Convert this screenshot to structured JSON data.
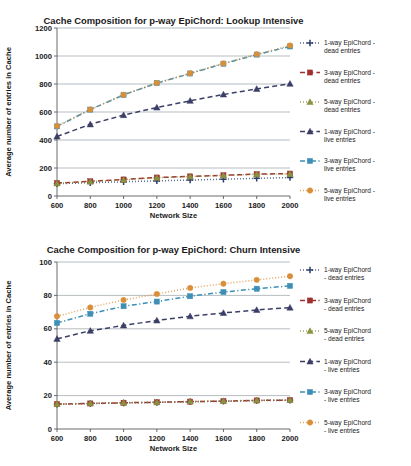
{
  "figure": {
    "name": "cache-composition-figure",
    "panel_count": 2
  },
  "palette": {
    "dead_1way": "#2b3f6c",
    "dead_3way": "#9e3030",
    "dead_5way": "#8a9141",
    "live_1way": "#3b3f66",
    "live_3way": "#3d8fb5",
    "live_5way": "#d98f3a",
    "gridline": "#9aa0a6",
    "axis": "#595959",
    "text": "#1a1a1a",
    "background": "#ffffff"
  },
  "chart_data": [
    {
      "id": "lookup-intensive",
      "type": "line",
      "title": "Cache Composition for p-way EpiChord: Lookup Intensive",
      "xlabel": "Network Size",
      "ylabel": "Average number of entries in Cache",
      "x": [
        600,
        800,
        1000,
        1200,
        1400,
        1600,
        1800,
        2000
      ],
      "xlim": [
        600,
        2000
      ],
      "ylim": [
        0,
        1200
      ],
      "yticks": [
        0,
        200,
        400,
        600,
        800,
        1000,
        1200
      ],
      "xticks": [
        600,
        800,
        1000,
        1200,
        1400,
        1600,
        1800,
        2000
      ],
      "grid": true,
      "legend_position": "right",
      "series": [
        {
          "name": "1-way EpiChord - dead entries",
          "key": "dead_1way",
          "color": "#2b3f6c",
          "dash": "dotted",
          "marker": "plus",
          "values": [
            88,
            95,
            102,
            108,
            114,
            120,
            126,
            132
          ]
        },
        {
          "name": "3-way EpiChord - dead entries",
          "key": "dead_3way",
          "color": "#9e3030",
          "dash": "dashed",
          "marker": "square",
          "values": [
            92,
            105,
            118,
            132,
            140,
            148,
            156,
            160
          ]
        },
        {
          "name": "5-way EpiChord - dead entries",
          "key": "dead_5way",
          "color": "#8a9141",
          "dash": "dotted",
          "marker": "triangle",
          "values": [
            90,
            103,
            116,
            130,
            139,
            147,
            155,
            158
          ]
        },
        {
          "name": "1-way EpiChord - live entries",
          "key": "live_1way",
          "color": "#3b3f66",
          "dash": "dashed",
          "marker": "triangle",
          "values": [
            425,
            512,
            578,
            632,
            680,
            725,
            765,
            802
          ]
        },
        {
          "name": "3-way EpiChord - live entries",
          "key": "live_3way",
          "color": "#3d8fb5",
          "dash": "dashdot",
          "marker": "square",
          "values": [
            497,
            617,
            722,
            806,
            875,
            945,
            1010,
            1068
          ]
        },
        {
          "name": "5-way EpiChord - live entries",
          "key": "live_5way",
          "color": "#d98f3a",
          "dash": "dotted",
          "marker": "circle",
          "values": [
            500,
            618,
            723,
            807,
            877,
            947,
            1012,
            1075
          ]
        }
      ]
    },
    {
      "id": "churn-intensive",
      "type": "line",
      "title": "Cache Composition for p-way EpiChord: Churn Intensive",
      "xlabel": "Network Size",
      "ylabel": "Average number of entries in Cache",
      "x": [
        600,
        800,
        1000,
        1200,
        1400,
        1600,
        1800,
        2000
      ],
      "xlim": [
        600,
        2000
      ],
      "ylim": [
        0,
        100
      ],
      "yticks": [
        0,
        20,
        40,
        60,
        80,
        100
      ],
      "xticks": [
        600,
        800,
        1000,
        1200,
        1400,
        1600,
        1800,
        2000
      ],
      "grid": true,
      "legend_position": "right",
      "series": [
        {
          "name": "1-way EpiChord - dead entries",
          "key": "dead_1way",
          "color": "#2b3f6c",
          "dash": "dotted",
          "marker": "plus",
          "values": [
            14.8,
            15.2,
            15.6,
            15.9,
            16.3,
            16.6,
            17.0,
            17.2
          ]
        },
        {
          "name": "3-way EpiChord - dead entries",
          "key": "dead_3way",
          "color": "#9e3030",
          "dash": "dashdot",
          "marker": "square",
          "values": [
            14.9,
            15.3,
            15.7,
            16.0,
            16.4,
            16.7,
            17.1,
            17.3
          ]
        },
        {
          "name": "5-way EpiChord - dead entries",
          "key": "dead_5way",
          "color": "#8a9141",
          "dash": "dotted",
          "marker": "triangle",
          "values": [
            15.0,
            15.4,
            15.8,
            16.1,
            16.5,
            16.8,
            17.2,
            17.4
          ]
        },
        {
          "name": "1-way EpiChord - live entries",
          "key": "live_1way",
          "color": "#3b3f66",
          "dash": "dashed",
          "marker": "triangle",
          "values": [
            54.0,
            58.8,
            62.0,
            65.0,
            67.5,
            69.5,
            71.3,
            72.7
          ]
        },
        {
          "name": "3-way EpiChord - live entries",
          "key": "live_3way",
          "color": "#3d8fb5",
          "dash": "dashdot",
          "marker": "square",
          "values": [
            63.5,
            69.0,
            73.5,
            76.3,
            79.5,
            82.0,
            84.0,
            85.7
          ]
        },
        {
          "name": "5-way EpiChord - live entries",
          "key": "live_5way",
          "color": "#d98f3a",
          "dash": "dotted",
          "marker": "circle",
          "values": [
            67.5,
            72.8,
            77.3,
            80.8,
            84.5,
            87.0,
            89.3,
            91.5
          ]
        }
      ]
    }
  ],
  "legend": {
    "top": [
      {
        "line1": "1-way EpiChord -",
        "line2": "dead entries"
      },
      {
        "line1": "3-way EpiChord -",
        "line2": "dead entries"
      },
      {
        "line1": "5-way EpiChord -",
        "line2": "dead entries"
      },
      {
        "line1": "1-way EpiChord -",
        "line2": "live entries"
      },
      {
        "line1": "3-way EpiChord -",
        "line2": "live entries"
      },
      {
        "line1": "5-way EpiChord -",
        "line2": "live entries"
      }
    ],
    "bottom": [
      {
        "line1": "1-way EpiChord",
        "line2": "- dead entries"
      },
      {
        "line1": "3-way EpiChord",
        "line2": "- dead entries"
      },
      {
        "line1": "5-way EpiChord",
        "line2": "- dead entries"
      },
      {
        "line1": "1-way EpiChord",
        "line2": "- live entries"
      },
      {
        "line1": "3-way EpiChord",
        "line2": "- live entries"
      },
      {
        "line1": "5-way EpiChord",
        "line2": "- live entries"
      }
    ]
  }
}
